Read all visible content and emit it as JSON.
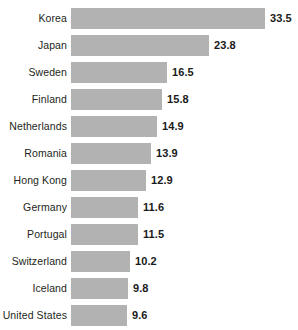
{
  "chart_data": {
    "type": "bar",
    "orientation": "horizontal",
    "title": "",
    "subtitle": "",
    "xlabel": "",
    "ylabel": "",
    "grid": false,
    "legend": false,
    "legend_position": "none",
    "axis_visible": false,
    "tick_labels_x": [],
    "xlim": [
      0,
      33.5
    ],
    "categories": [
      "Korea",
      "Japan",
      "Sweden",
      "Finland",
      "Netherlands",
      "Romania",
      "Hong Kong",
      "Germany",
      "Portugal",
      "Switzerland",
      "Iceland",
      "United States"
    ],
    "values": [
      33.5,
      23.8,
      16.5,
      15.8,
      14.9,
      13.9,
      12.9,
      11.6,
      11.5,
      10.2,
      9.8,
      9.6
    ],
    "value_labels": [
      "33.5",
      "23.8",
      "16.5",
      "15.8",
      "14.9",
      "13.9",
      "12.9",
      "11.6",
      "11.5",
      "10.2",
      "9.8",
      "9.6"
    ],
    "bar_color": "#b2b2b2",
    "label_color": "#231f20",
    "value_color": "#1a1a1a",
    "background_color": "#ffffff"
  },
  "layout": {
    "bar_origin_x": 71,
    "bar_height": 21,
    "row_pitch": 27,
    "first_row_top": 8,
    "px_per_unit": 5.79,
    "value_gap": 5,
    "label_right_edge": 67
  }
}
